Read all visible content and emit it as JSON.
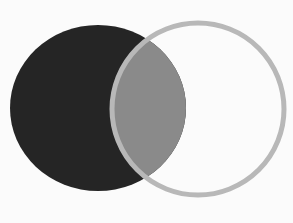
{
  "diagram": {
    "type": "venn",
    "width": 293,
    "height": 223,
    "background": "#fbfbfb",
    "sets": [
      {
        "id": "left-filled-set",
        "shape": "ellipse",
        "cx": 98,
        "cy": 108,
        "rx": 88,
        "ry": 83,
        "fill": "#252525",
        "stroke": "none"
      },
      {
        "id": "right-outline-set",
        "shape": "ellipse",
        "cx": 198,
        "cy": 109,
        "rx": 86,
        "ry": 86,
        "fill": "none",
        "stroke": "#b8b8b8",
        "stroke_width": 5
      }
    ],
    "intersection": {
      "fill": "#8a8a8a"
    }
  }
}
